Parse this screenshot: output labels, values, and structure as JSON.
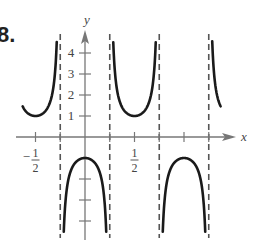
{
  "problem": {
    "number_label": "8."
  },
  "chart_data": {
    "type": "line",
    "title": "",
    "function": "y = -sec(2πx)",
    "xlabel": "x",
    "ylabel": "y",
    "xlim": [
      -0.625,
      1.375
    ],
    "ylim": [
      -4.7,
      4.6
    ],
    "grid": false,
    "legend": null,
    "x_ticks": [
      -0.5,
      -0.25,
      0,
      0.25,
      0.5,
      0.75,
      1,
      1.25
    ],
    "x_tick_labels": [
      {
        "value": -0.5,
        "num": "1",
        "den": "2",
        "sign": "−"
      },
      {
        "value": 0.5,
        "num": "1",
        "den": "2",
        "sign": ""
      }
    ],
    "y_ticks": [
      4,
      3,
      2,
      1,
      -2,
      -3,
      -4
    ],
    "y_tick_labels": [
      "4",
      "3",
      "2",
      "1"
    ],
    "asymptotes_x": [
      -0.25,
      0.25,
      0.75,
      1.25
    ],
    "branches": [
      {
        "name": "left-partial-upward",
        "x_range": [
          -0.63,
          -0.255
        ],
        "vertex": [
          -0.5,
          1
        ]
      },
      {
        "name": "center-downward",
        "x_range": [
          -0.235,
          0.235
        ],
        "vertex": [
          0,
          -1
        ]
      },
      {
        "name": "middle-upward",
        "x_range": [
          0.265,
          0.735
        ],
        "vertex": [
          0.5,
          1
        ]
      },
      {
        "name": "right-downward",
        "x_range": [
          0.765,
          1.235
        ],
        "vertex": [
          1,
          -1
        ]
      },
      {
        "name": "right-partial-upward",
        "x_range": [
          1.255,
          1.37
        ],
        "vertex": [
          1.5,
          1
        ]
      }
    ],
    "colors": {
      "curve": "#1a1a1a",
      "axes": "#777777",
      "asymptote": "#555555"
    }
  }
}
